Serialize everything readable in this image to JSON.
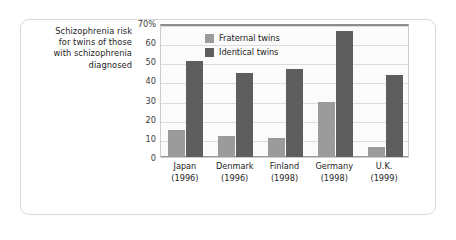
{
  "caption": {
    "lines": [
      "Schizophrenia risk",
      "for twins of those",
      "with schizophrenia",
      "diagnosed"
    ]
  },
  "colors": {
    "fraternal": "#9b9b9b",
    "identical": "#5e5e5e",
    "gridline": "#dcdcdc",
    "panel_background": "#fbfbfb",
    "card_border": "#d8d8d8",
    "text": "#242424"
  },
  "legend": {
    "position": "top-left-inside-plot",
    "entries": [
      {
        "label": "Fraternal twins",
        "color": "#9b9b9b"
      },
      {
        "label": "Identical twins",
        "color": "#5e5e5e"
      }
    ]
  },
  "axis": {
    "y_ticks": [
      "70%",
      "60",
      "50",
      "40",
      "30",
      "20",
      "10",
      "0"
    ],
    "y_values": [
      70,
      60,
      50,
      40,
      30,
      20,
      10,
      0
    ]
  },
  "chart_data": {
    "type": "bar",
    "title": "Schizophrenia risk for twins of those with schizophrenia diagnosed",
    "xlabel": "",
    "ylabel": "",
    "ylim": [
      0,
      70
    ],
    "grid": true,
    "legend_position": "upper left",
    "categories": [
      "Japan",
      "Denmark",
      "Finland",
      "Germany",
      "U.K."
    ],
    "category_years": [
      "(1996)",
      "(1996)",
      "(1998)",
      "(1998)",
      "(1999)"
    ],
    "tick_labels": [
      "70%",
      "60",
      "50",
      "40",
      "30",
      "20",
      "10",
      "0"
    ],
    "series": [
      {
        "name": "Fraternal twins",
        "color": "#9b9b9b",
        "values": [
          14,
          11,
          10,
          29,
          5
        ]
      },
      {
        "name": "Identical twins",
        "color": "#5e5e5e",
        "values": [
          50,
          44,
          46,
          66,
          43
        ]
      }
    ]
  }
}
